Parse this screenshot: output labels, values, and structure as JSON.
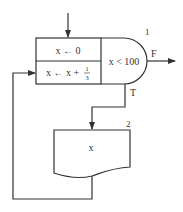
{
  "diagram": {
    "type": "flowchart",
    "nodes": [
      {
        "id": "init",
        "label": "x ← 0"
      },
      {
        "id": "update",
        "label_prefix": "x ← x + ",
        "frac_num": "1",
        "frac_den": "3"
      },
      {
        "id": "cond",
        "label": "x < 100",
        "number": "1"
      },
      {
        "id": "output",
        "label": "x",
        "number": "2"
      }
    ],
    "edges": [
      {
        "from": "start",
        "to": "init"
      },
      {
        "from": "cond",
        "to": "exit",
        "label": "F"
      },
      {
        "from": "cond",
        "to": "output",
        "label": "T"
      },
      {
        "from": "output",
        "to": "update"
      }
    ],
    "line_color": "#333333"
  }
}
